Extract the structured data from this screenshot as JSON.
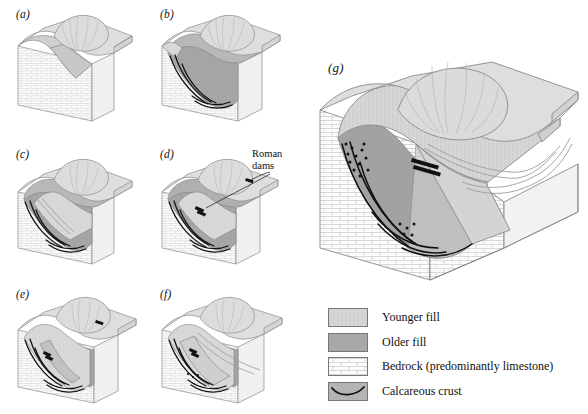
{
  "figure": {
    "type": "geomorphology-block-diagram-series",
    "panels": [
      {
        "id": "a",
        "label": "(a)"
      },
      {
        "id": "b",
        "label": "(b)"
      },
      {
        "id": "c",
        "label": "(c)"
      },
      {
        "id": "d",
        "label": "(d)"
      },
      {
        "id": "e",
        "label": "(e)"
      },
      {
        "id": "f",
        "label": "(f)"
      },
      {
        "id": "g",
        "label": "(g)"
      }
    ],
    "annotations": [
      {
        "id": "roman-dams",
        "line1": "Roman",
        "line2": "dams"
      }
    ]
  },
  "legend": {
    "items": [
      {
        "key": "younger-fill",
        "label": "Younger fill",
        "color": "#d2d2d2"
      },
      {
        "key": "older-fill",
        "label": "Older fill",
        "color": "#a8a8a8"
      },
      {
        "key": "bedrock",
        "label": "Bedrock (predominantly limestone)",
        "color": "#fbfbfb"
      },
      {
        "key": "crust",
        "label": "Calcareous crust",
        "color": "#b4b4b4"
      }
    ]
  },
  "colors": {
    "younger_fill": "#d2d2d2",
    "older_fill": "#a8a8a8",
    "bedrock": "#fbfbfb",
    "crust_line": "#111111",
    "hill": "#dcdcdc",
    "outline": "#8a8a8a",
    "background": "#ffffff"
  }
}
